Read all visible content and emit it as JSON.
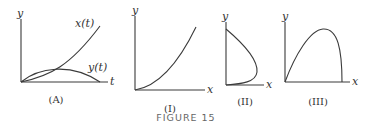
{
  "figure": {
    "caption": "FIGURE 15",
    "panels": [
      {
        "id": "A",
        "caption": "(A)",
        "y_axis_label": "y",
        "x_axis_label": "t",
        "curves": [
          {
            "name": "x(t)",
            "label": "x(t)",
            "shape": "convex increasing from origin"
          },
          {
            "name": "y(t)",
            "label": "y(t)",
            "shape": "arch rising then falling back to axis"
          }
        ]
      },
      {
        "id": "I",
        "caption": "(I)",
        "y_axis_label": "y",
        "x_axis_label": "x",
        "curves": [
          {
            "name": "curve-I",
            "shape": "convex increasing from origin"
          }
        ]
      },
      {
        "id": "II",
        "caption": "(II)",
        "y_axis_label": "y",
        "x_axis_label": "x",
        "curves": [
          {
            "name": "curve-II",
            "shape": "loop starting on y-axis, bulging right, returning to origin"
          }
        ]
      },
      {
        "id": "III",
        "caption": "(III)",
        "y_axis_label": "y",
        "x_axis_label": "x",
        "curves": [
          {
            "name": "curve-III",
            "shape": "skewed arch from origin, peak right of center, steep drop to x-axis"
          }
        ]
      }
    ]
  }
}
